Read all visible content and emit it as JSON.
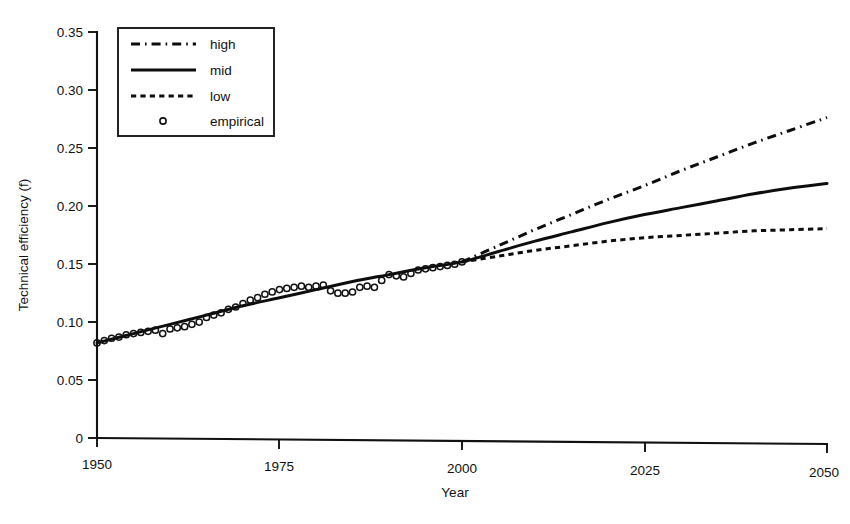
{
  "figure": {
    "background_color": "#ffffff",
    "ink_color": "#111111"
  },
  "axes": {
    "x_title": "Year",
    "y_title": "Technical efficiency (f)",
    "x_ticks": [
      "1950",
      "1975",
      "2000",
      "2025",
      "2050"
    ],
    "y_ticks": [
      "0",
      "0.05",
      "0.10",
      "0.15",
      "0.20",
      "0.25",
      "0.30",
      "0.35"
    ]
  },
  "legend": {
    "items": [
      {
        "label": "high",
        "style": "dash-dot"
      },
      {
        "label": "mid",
        "style": "solid"
      },
      {
        "label": "low",
        "style": "dotted"
      },
      {
        "label": "empirical",
        "style": "circle-marker"
      }
    ]
  },
  "chart_data": {
    "type": "line",
    "title": "",
    "xlabel": "Year",
    "ylabel": "Technical efficiency (f)",
    "xlim": [
      1950,
      2050
    ],
    "ylim": [
      0,
      0.35
    ],
    "xticks": [
      1950,
      1975,
      2000,
      2025,
      2050
    ],
    "yticks": [
      0,
      0.05,
      0.1,
      0.15,
      0.2,
      0.25,
      0.3,
      0.35
    ],
    "grid": false,
    "legend_position": "top-left",
    "series": [
      {
        "name": "high",
        "style": "dash-dot",
        "x": [
          2000,
          2005,
          2010,
          2015,
          2020,
          2025,
          2030,
          2035,
          2040,
          2045,
          2050
        ],
        "values": [
          0.152,
          0.166,
          0.18,
          0.193,
          0.206,
          0.218,
          0.231,
          0.243,
          0.255,
          0.266,
          0.277
        ]
      },
      {
        "name": "mid",
        "style": "solid",
        "x": [
          1950,
          1955,
          1960,
          1965,
          1970,
          1975,
          1980,
          1985,
          1990,
          1995,
          2000,
          2005,
          2010,
          2015,
          2020,
          2025,
          2030,
          2035,
          2040,
          2045,
          2050
        ],
        "values": [
          0.082,
          0.09,
          0.098,
          0.106,
          0.114,
          0.121,
          0.128,
          0.135,
          0.141,
          0.147,
          0.152,
          0.161,
          0.17,
          0.178,
          0.186,
          0.193,
          0.199,
          0.205,
          0.211,
          0.216,
          0.22
        ]
      },
      {
        "name": "low",
        "style": "dotted",
        "x": [
          2000,
          2005,
          2010,
          2015,
          2020,
          2025,
          2030,
          2035,
          2040,
          2045,
          2050
        ],
        "values": [
          0.152,
          0.157,
          0.162,
          0.166,
          0.17,
          0.173,
          0.175,
          0.177,
          0.179,
          0.18,
          0.181
        ]
      },
      {
        "name": "empirical",
        "style": "circle-marker",
        "x": [
          1950,
          1951,
          1952,
          1953,
          1954,
          1955,
          1956,
          1957,
          1958,
          1959,
          1960,
          1961,
          1962,
          1963,
          1964,
          1965,
          1966,
          1967,
          1968,
          1969,
          1970,
          1971,
          1972,
          1973,
          1974,
          1975,
          1976,
          1977,
          1978,
          1979,
          1980,
          1981,
          1982,
          1983,
          1984,
          1985,
          1986,
          1987,
          1988,
          1989,
          1990,
          1991,
          1992,
          1993,
          1994,
          1995,
          1996,
          1997,
          1998,
          1999,
          2000
        ],
        "values": [
          0.082,
          0.084,
          0.086,
          0.087,
          0.089,
          0.09,
          0.091,
          0.092,
          0.093,
          0.09,
          0.094,
          0.095,
          0.096,
          0.098,
          0.1,
          0.104,
          0.106,
          0.108,
          0.111,
          0.113,
          0.116,
          0.119,
          0.121,
          0.124,
          0.126,
          0.128,
          0.129,
          0.13,
          0.131,
          0.13,
          0.131,
          0.132,
          0.127,
          0.125,
          0.125,
          0.126,
          0.13,
          0.131,
          0.13,
          0.136,
          0.141,
          0.14,
          0.139,
          0.142,
          0.145,
          0.146,
          0.147,
          0.148,
          0.149,
          0.15,
          0.152
        ]
      }
    ]
  },
  "artifacts": {
    "top_bleed_text": "",
    "caption_partial": ""
  }
}
